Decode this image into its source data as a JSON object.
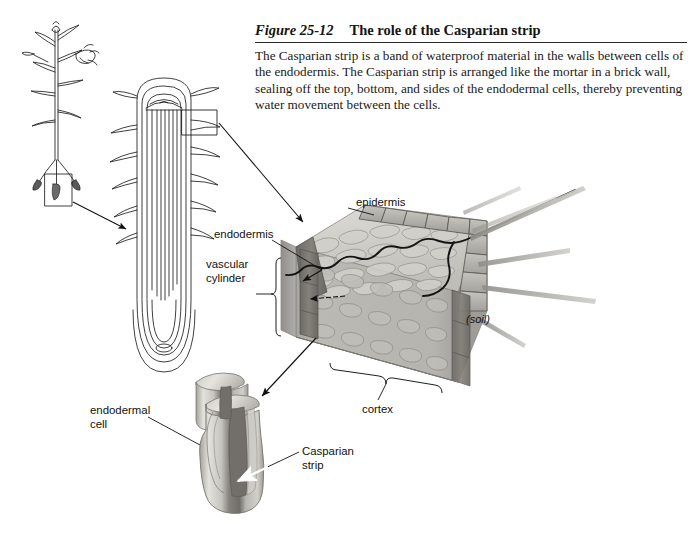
{
  "figure": {
    "number": "Figure 25-12",
    "title": "The role of the Casparian strip",
    "body": "The Casparian strip is a band of waterproof material in the walls between cells of the endodermis. The Casparian strip is arranged like the mortar in a brick wall, sealing off the top, bottom, and sides of the endodermal cells, thereby preventing water movement between the cells."
  },
  "labels": {
    "epidermis": "epidermis",
    "endodermis": "endodermis",
    "vascular_cylinder": "vascular\ncylinder",
    "soil": "(soil)",
    "cortex": "cortex",
    "endodermal_cell": "endodermal\ncell",
    "casparian_strip": "Casparian\nstrip"
  },
  "colors": {
    "page_background": "#ffffff",
    "ink": "#111111",
    "rule": "#2a2a2a",
    "cortex_fill": "#c9c7c2",
    "cortex_fill_light": "#d6d4cf",
    "cortex_front_face": "#b4b2ad",
    "cell_outline": "#8d8b86",
    "epidermis_fill": "#b9b7b2",
    "epidermis_outline": "#6f6d69",
    "endodermis_dark": "#7c7a76",
    "endodermis_darker": "#66645f",
    "root_hair": "#a8a6a1",
    "water_path": "#1a1a1a",
    "cell_body_light": "#d8d6d1",
    "cell_body_mid": "#bdbbb6",
    "casparian_band": "#7a7874"
  }
}
